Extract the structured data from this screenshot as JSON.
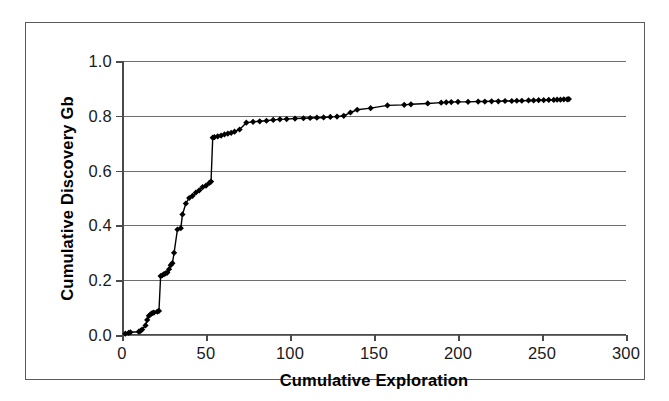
{
  "chart_data": {
    "type": "line",
    "title": "",
    "subtitle": "",
    "xlabel": "Cumulative Exploration",
    "ylabel": "Cumulative Discovery Gb",
    "xlim": [
      0,
      300
    ],
    "ylim": [
      0.0,
      1.0
    ],
    "xticks": [
      0,
      50,
      100,
      150,
      200,
      250,
      300
    ],
    "xtick_labels": [
      "0",
      "50",
      "100",
      "150",
      "200",
      "250",
      "300"
    ],
    "yticks": [
      0.0,
      0.2,
      0.4,
      0.6,
      0.8,
      1.0
    ],
    "ytick_labels": [
      "0.0",
      "0.2",
      "0.4",
      "0.6",
      "0.8",
      "1.0"
    ],
    "grid": "horizontal",
    "legend": null,
    "marker": "diamond",
    "marker_color": "#000000",
    "line_color": "#000000",
    "series": [
      {
        "name": "Cumulative Discovery",
        "x": [
          2,
          4,
          5,
          10,
          11,
          12,
          14,
          15,
          16,
          17,
          18,
          19,
          21,
          22,
          23,
          24,
          25,
          26,
          27,
          28,
          29,
          30,
          31,
          33,
          35,
          36,
          38,
          40,
          42,
          44,
          46,
          48,
          50,
          52,
          53,
          54,
          55,
          57,
          59,
          61,
          63,
          65,
          67,
          70,
          74,
          78,
          82,
          86,
          90,
          94,
          98,
          103,
          108,
          112,
          116,
          120,
          124,
          128,
          132,
          136,
          140,
          148,
          158,
          168,
          172,
          182,
          190,
          193,
          196,
          200,
          206,
          212,
          216,
          220,
          224,
          228,
          232,
          235,
          238,
          242,
          245,
          248,
          251,
          254,
          257,
          259,
          261,
          263,
          265,
          266
        ],
        "y": [
          0.005,
          0.008,
          0.01,
          0.012,
          0.015,
          0.02,
          0.035,
          0.055,
          0.07,
          0.075,
          0.08,
          0.082,
          0.085,
          0.088,
          0.215,
          0.218,
          0.222,
          0.225,
          0.228,
          0.24,
          0.255,
          0.262,
          0.3,
          0.385,
          0.39,
          0.44,
          0.48,
          0.5,
          0.508,
          0.52,
          0.528,
          0.54,
          0.545,
          0.555,
          0.56,
          0.72,
          0.722,
          0.725,
          0.728,
          0.732,
          0.735,
          0.738,
          0.742,
          0.75,
          0.775,
          0.778,
          0.78,
          0.782,
          0.785,
          0.787,
          0.788,
          0.79,
          0.791,
          0.792,
          0.793,
          0.794,
          0.796,
          0.797,
          0.8,
          0.812,
          0.822,
          0.828,
          0.838,
          0.84,
          0.842,
          0.845,
          0.848,
          0.849,
          0.85,
          0.851,
          0.851,
          0.852,
          0.852,
          0.853,
          0.853,
          0.854,
          0.854,
          0.855,
          0.855,
          0.856,
          0.856,
          0.857,
          0.857,
          0.858,
          0.858,
          0.859,
          0.859,
          0.86,
          0.86,
          0.861
        ]
      }
    ]
  }
}
